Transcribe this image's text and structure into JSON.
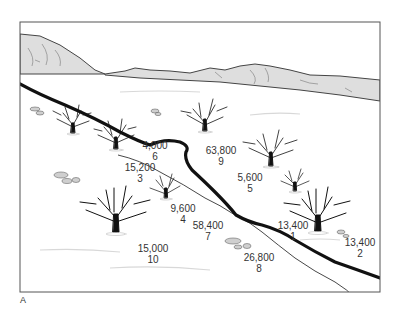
{
  "figure": {
    "panel_letter": "A",
    "colors": {
      "frame": "#555555",
      "mountain_fill": "#dedede",
      "river": "#111111",
      "trail": "#333333",
      "text": "#333333"
    },
    "sites": [
      {
        "id": "site-6",
        "value": "4,000",
        "number": "6",
        "x": 155,
        "y": 140
      },
      {
        "id": "site-9",
        "value": "63,800",
        "number": "9",
        "x": 221,
        "y": 145
      },
      {
        "id": "site-3",
        "value": "15,200",
        "number": "3",
        "x": 140,
        "y": 162
      },
      {
        "id": "site-5",
        "value": "5,600",
        "number": "5",
        "x": 250,
        "y": 172
      },
      {
        "id": "site-4",
        "value": "9,600",
        "number": "4",
        "x": 183,
        "y": 203
      },
      {
        "id": "site-7",
        "value": "58,400",
        "number": "7",
        "x": 208,
        "y": 220
      },
      {
        "id": "site-1",
        "value": "13,400",
        "number": "1",
        "x": 293,
        "y": 220
      },
      {
        "id": "site-2",
        "value": "13,400",
        "number": "2",
        "x": 360,
        "y": 237
      },
      {
        "id": "site-10",
        "value": "15,000",
        "number": "10",
        "x": 153,
        "y": 243
      },
      {
        "id": "site-8",
        "value": "26,800",
        "number": "8",
        "x": 259,
        "y": 252
      }
    ]
  }
}
